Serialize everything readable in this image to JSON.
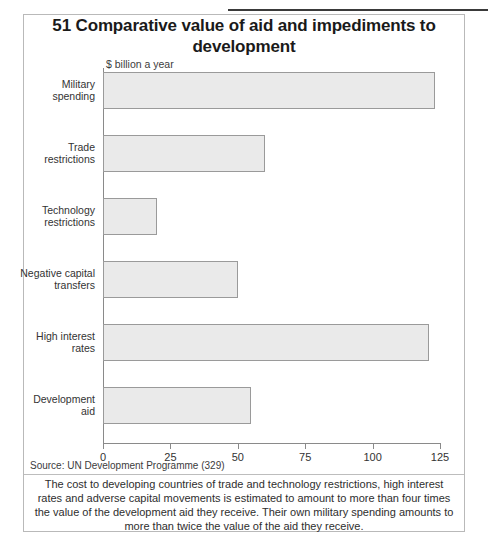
{
  "figure": {
    "number": "51",
    "title": "51 Comparative value of aid and impediments to development",
    "source": "Source: UN Development Programme (329)",
    "caption": "The cost to developing countries of trade and technology restrictions, high interest rates and adverse capital movements is estimated to amount to more than four times the value of the development aid they receive. Their own military spending amounts to more than twice the value of the aid they receive."
  },
  "chart_data": {
    "type": "bar",
    "orientation": "horizontal",
    "title": "51 Comparative value of aid and impediments to development",
    "subtitle": "$ billion a year",
    "xlabel": "$ billion a year",
    "ylabel": "",
    "categories": [
      "Military spending",
      "Trade restrictions",
      "Technology restrictions",
      "Negative capital transfers",
      "High interest rates",
      "Development aid"
    ],
    "values": [
      123,
      60,
      20,
      50,
      121,
      55
    ],
    "xlim": [
      0,
      125
    ],
    "xticks": [
      0,
      25,
      50,
      75,
      100,
      125
    ],
    "xtick_labels": [
      "0",
      "25",
      "50",
      "75",
      "100",
      "125"
    ],
    "grid": false,
    "legend": false,
    "bar_fill_color": "#eaeaea",
    "bar_border_color": "#9a9a9a",
    "axis_color": "#8a8a8a"
  },
  "category_label_lines": [
    [
      "Military",
      "spending"
    ],
    [
      "Trade",
      "restrictions"
    ],
    [
      "Technology",
      "restrictions"
    ],
    [
      "Negative capital",
      "transfers"
    ],
    [
      "High interest",
      "rates"
    ],
    [
      "Development",
      "aid"
    ]
  ]
}
